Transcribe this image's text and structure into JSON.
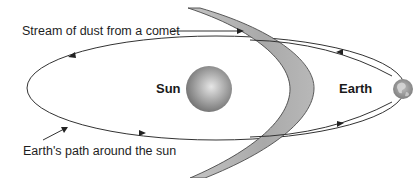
{
  "diagram": {
    "labels": {
      "comet_stream": "Stream of dust from a comet",
      "sun": "Sun",
      "earth": "Earth",
      "earth_path": "Earth's path around the sun"
    },
    "elements": [
      {
        "name": "sun",
        "shape": "sphere",
        "color": "#9a9a9a"
      },
      {
        "name": "earth",
        "shape": "globe",
        "color": "#8c8c8c"
      },
      {
        "name": "earth-orbit",
        "shape": "ellipse",
        "direction": "counterclockwise"
      },
      {
        "name": "comet-dust-stream",
        "shape": "crescent band",
        "color": "#b4b4b4"
      }
    ],
    "colors": {
      "line": "#333333",
      "band_fill": "#b3b3b3",
      "band_edge": "#4a4a4a",
      "text": "#1e1e1e"
    }
  }
}
